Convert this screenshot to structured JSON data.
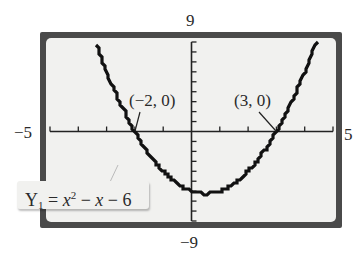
{
  "chart_data": {
    "type": "line",
    "title": "",
    "function": "Y1 = x^2 - x - 6",
    "xlim": [
      -5,
      5
    ],
    "ylim": [
      -9,
      9
    ],
    "x_ticks_step": 1,
    "y_ticks_step": 1,
    "window_labels": {
      "xmin": "−5",
      "xmax": "5",
      "ymin": "−9",
      "ymax": "9"
    },
    "annotations": [
      {
        "label": "(−2, 0)",
        "x": -2,
        "y": 0
      },
      {
        "label": "(3, 0)",
        "x": 3,
        "y": 0
      }
    ],
    "series": [
      {
        "name": "Y1",
        "x": [
          -2.6,
          -2,
          -1,
          0,
          0.5,
          1,
          2,
          3,
          4.3
        ],
        "y": [
          2.36,
          0,
          -4,
          -6,
          -6.25,
          -6,
          -4,
          0,
          8.19
        ]
      }
    ],
    "grid": false,
    "legend": "equation label lower-left"
  },
  "labels": {
    "ymax": "9",
    "ymin": "−9",
    "xmin": "−5",
    "xmax": "5",
    "root_left": "(−2, 0)",
    "root_right": "(3, 0)",
    "eq_Y": "Y",
    "eq_sub": "1",
    "eq_eq": " = ",
    "eq_x": "x",
    "eq_sup": "2",
    "eq_rest1": " − ",
    "eq_x2": "x",
    "eq_rest2": " − 6"
  },
  "colors": {
    "frame": "#4a4a4a",
    "screen": "#f1f1ef",
    "curve": "#111111"
  }
}
